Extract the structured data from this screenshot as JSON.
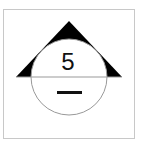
{
  "diagram": {
    "upper_value": "5",
    "lower_value": "—",
    "colors": {
      "frame": "#c8c8c8",
      "triangle": "#000000",
      "circle": "#999999",
      "divider": "#999999",
      "text": "#111111"
    }
  }
}
